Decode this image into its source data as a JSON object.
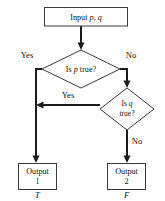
{
  "diagram": {
    "background_color": "#ffffff",
    "line_color": "#1c1c1c",
    "shape_stroke_color": "#3a3a3a",
    "shape_fill_color": "#ffffff",
    "nodes": {
      "input": {
        "type": "process-box",
        "text_prefix": "Input ",
        "var_p": "p",
        "separator": ", ",
        "var_q": "q",
        "full_text": "Input p, q"
      },
      "decision_p": {
        "type": "diamond",
        "text_prefix": "Is ",
        "var": "p",
        "text_suffix": " true?",
        "full_text": "Is p true?"
      },
      "decision_q": {
        "type": "diamond",
        "line1_prefix": "Is ",
        "line1_var": "q",
        "line2": "true?",
        "full_text": "Is q true?"
      },
      "output_1": {
        "type": "process-box",
        "line1": "Output",
        "line2": "1",
        "full_text": "Output 1"
      },
      "output_2": {
        "type": "process-box",
        "line1": "Output",
        "line2": "2",
        "full_text": "Output 2"
      }
    },
    "edge_labels": {
      "p_yes": "Yes",
      "p_no": "No",
      "q_yes": "Yes",
      "q_no": "No"
    },
    "truth_values": {
      "left": "T",
      "right": "F"
    }
  }
}
